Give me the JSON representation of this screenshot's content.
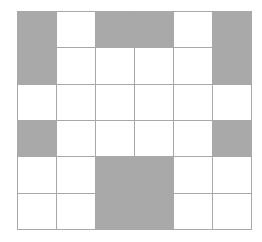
{
  "grid": {
    "rows": 6,
    "cols": 6,
    "filled_color": "#a9a9a9",
    "empty_color": "#ffffff",
    "line_color": "#a8a8a8",
    "cells": [
      [
        1,
        0,
        1,
        1,
        0,
        1
      ],
      [
        1,
        0,
        0,
        0,
        0,
        1
      ],
      [
        0,
        0,
        0,
        0,
        0,
        0
      ],
      [
        1,
        0,
        0,
        0,
        0,
        1
      ],
      [
        0,
        0,
        1,
        1,
        0,
        0
      ],
      [
        0,
        0,
        1,
        1,
        0,
        0
      ]
    ]
  }
}
